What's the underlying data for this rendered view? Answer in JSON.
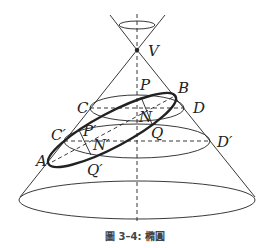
{
  "figure": {
    "caption": "圖 3–4: 橢圓"
  },
  "labels": {
    "V": "V",
    "P": "P",
    "B": "B",
    "C": "C",
    "D": "D",
    "N": "N",
    "C_prime": "C′",
    "P_prime": "P′",
    "Q": "Q",
    "D_prime": "D′",
    "N_prime": "N′",
    "A": "A",
    "Q_prime": "Q′"
  },
  "colors": {
    "stroke": "#222222",
    "background": "#ffffff"
  }
}
